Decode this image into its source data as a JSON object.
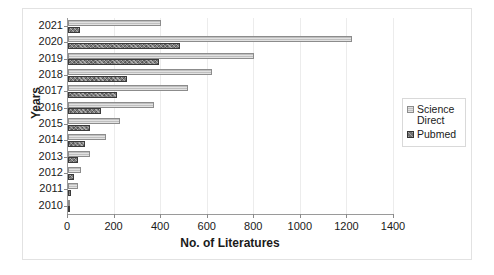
{
  "chart_data": {
    "type": "bar",
    "orientation": "horizontal",
    "title": "",
    "xlabel": "No. of Literatures",
    "ylabel": "Years",
    "categories": [
      "2021",
      "2020",
      "2019",
      "2018",
      "2017",
      "2016",
      "2015",
      "2014",
      "2013",
      "2012",
      "2011",
      "2010"
    ],
    "series": [
      {
        "name": "Science Direct",
        "values": [
          400,
          1220,
          800,
          620,
          515,
          370,
          225,
          165,
          95,
          55,
          42,
          6
        ]
      },
      {
        "name": "Pubmed",
        "values": [
          52,
          480,
          390,
          255,
          210,
          140,
          95,
          75,
          45,
          25,
          12,
          5
        ]
      }
    ],
    "xlim": [
      0,
      1400
    ],
    "xticks": [
      0,
      200,
      400,
      600,
      800,
      1000,
      1200,
      1400
    ],
    "xtick_labels": [
      "0",
      "200",
      "400",
      "600",
      "800",
      "1000",
      "1200",
      "1400"
    ],
    "grid": true,
    "legend_position": "right",
    "colors": {
      "science_direct": "#bfbfbf",
      "pubmed": "#7d7d7d",
      "axis": "#9a9a9a",
      "grid": "#ececec",
      "text": "#1a1a1a",
      "frame": "#e2e2e2"
    }
  },
  "legend": {
    "items": [
      {
        "label": "Science Direct",
        "swatch": "science-direct-swatch-icon"
      },
      {
        "label": "Pubmed",
        "swatch": "pubmed-swatch-icon"
      }
    ]
  }
}
